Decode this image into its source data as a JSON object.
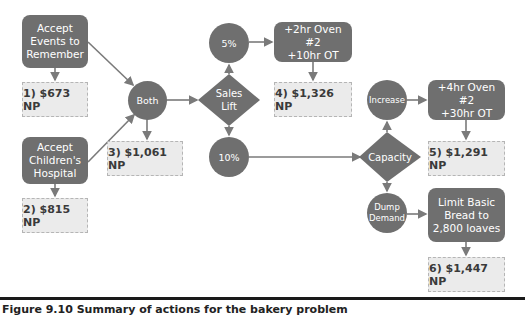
{
  "figure": {
    "caption": "Figure 9.10  Summary of actions for the bakery problem",
    "colors": {
      "node_fill": "#6f6f6f",
      "result_fill": "#ebebeb",
      "result_border": "#b5b5b5",
      "edge": "#7a7a7a",
      "rule": "#1a1a1a"
    }
  },
  "nodes": {
    "accept_events": {
      "label": "Accept\nEvents to\nRemember",
      "type": "action"
    },
    "result_1": {
      "label": "1) $673 NP",
      "type": "result"
    },
    "accept_childrens": {
      "label": "Accept\nChildren's\nHospital",
      "type": "action"
    },
    "result_2": {
      "label": "2) $815 NP",
      "type": "result"
    },
    "both": {
      "label": "Both",
      "type": "event"
    },
    "result_3": {
      "label": "3) $1,061 NP",
      "type": "result"
    },
    "sales_lift": {
      "label": "Sales\nLift",
      "type": "decision"
    },
    "five_pct": {
      "label": "5%",
      "type": "event"
    },
    "ten_pct": {
      "label": "10%",
      "type": "event"
    },
    "oven_2hr": {
      "label": "+2hr Oven #2\n+10hr OT",
      "type": "action"
    },
    "result_4": {
      "label": "4) $1,326 NP",
      "type": "result"
    },
    "capacity": {
      "label": "Capacity",
      "type": "decision"
    },
    "increase": {
      "label": "Increase",
      "type": "event"
    },
    "oven_4hr": {
      "label": "+4hr Oven #2\n+30hr OT",
      "type": "action"
    },
    "result_5": {
      "label": "5) $1,291 NP",
      "type": "result"
    },
    "dump_demand": {
      "label": "Dump\nDemand",
      "type": "event"
    },
    "limit_bread": {
      "label": "Limit Basic\nBread to\n2,800 loaves",
      "type": "action"
    },
    "result_6": {
      "label": "6) $1,447 NP",
      "type": "result"
    }
  },
  "edges": [
    [
      "accept_events",
      "result_1"
    ],
    [
      "accept_events",
      "both"
    ],
    [
      "accept_childrens",
      "result_2"
    ],
    [
      "accept_childrens",
      "both"
    ],
    [
      "both",
      "result_3"
    ],
    [
      "both",
      "sales_lift"
    ],
    [
      "sales_lift",
      "five_pct"
    ],
    [
      "sales_lift",
      "ten_pct"
    ],
    [
      "five_pct",
      "oven_2hr"
    ],
    [
      "oven_2hr",
      "result_4"
    ],
    [
      "ten_pct",
      "capacity"
    ],
    [
      "capacity",
      "increase"
    ],
    [
      "capacity",
      "dump_demand"
    ],
    [
      "increase",
      "oven_4hr"
    ],
    [
      "oven_4hr",
      "result_5"
    ],
    [
      "dump_demand",
      "limit_bread"
    ],
    [
      "limit_bread",
      "result_6"
    ]
  ]
}
